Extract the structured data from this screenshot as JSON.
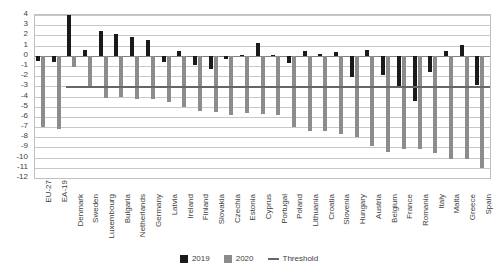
{
  "chart_data": {
    "type": "bar",
    "title": "",
    "subtitle": "",
    "xlabel": "",
    "ylabel": "",
    "ylim": [
      -12,
      4
    ],
    "yticks": [
      4,
      3,
      2,
      1,
      0,
      -1,
      -2,
      -3,
      -4,
      -5,
      -6,
      -7,
      -8,
      -9,
      -10,
      -11,
      -12
    ],
    "grid": true,
    "legend_position": "bottom",
    "categories": [
      "EU-27",
      "EA-19",
      "Denmark",
      "Sweden",
      "Luxembourg",
      "Bulgaria",
      "Netherlands",
      "Germany",
      "Latvia",
      "Ireland",
      "Finland",
      "Slovakia",
      "Czechia",
      "Estonia",
      "Cyprus",
      "Portugal",
      "Poland",
      "Lithuania",
      "Croatia",
      "Slovenia",
      "Hungary",
      "Austria",
      "Belgium",
      "France",
      "Romania",
      "Italy",
      "Malta",
      "Greece",
      "Spain"
    ],
    "series": [
      {
        "name": "2019",
        "color": "#1a1a1a",
        "values": [
          -0.5,
          -0.6,
          4.0,
          0.6,
          2.4,
          2.1,
          1.8,
          1.5,
          -0.6,
          0.5,
          -0.9,
          -1.3,
          -0.3,
          0.1,
          1.3,
          0.1,
          -0.7,
          0.5,
          0.2,
          0.4,
          -2.1,
          0.6,
          -1.9,
          -3.1,
          -4.4,
          -1.6,
          0.5,
          1.1,
          -2.9
        ]
      },
      {
        "name": "2020",
        "color": "#8c8c8c",
        "values": [
          -7.0,
          -7.2,
          -1.1,
          -3.1,
          -4.1,
          -4.0,
          -4.2,
          -4.2,
          -4.5,
          -5.0,
          -5.4,
          -5.5,
          -5.8,
          -5.6,
          -5.7,
          -5.8,
          -7.0,
          -7.4,
          -7.4,
          -7.7,
          -8.0,
          -8.9,
          -9.4,
          -9.2,
          -9.2,
          -9.5,
          -10.1,
          -10.1,
          -11.0
        ]
      }
    ],
    "threshold": {
      "name": "Threshold",
      "value": -3,
      "color": "#666666",
      "start_category": "Denmark",
      "end_category": "Spain"
    },
    "legend": [
      {
        "label": "2019",
        "type": "swatch",
        "color": "#1a1a1a"
      },
      {
        "label": "2020",
        "type": "swatch",
        "color": "#8c8c8c"
      },
      {
        "label": "Threshold",
        "type": "line",
        "color": "#666666"
      }
    ]
  }
}
